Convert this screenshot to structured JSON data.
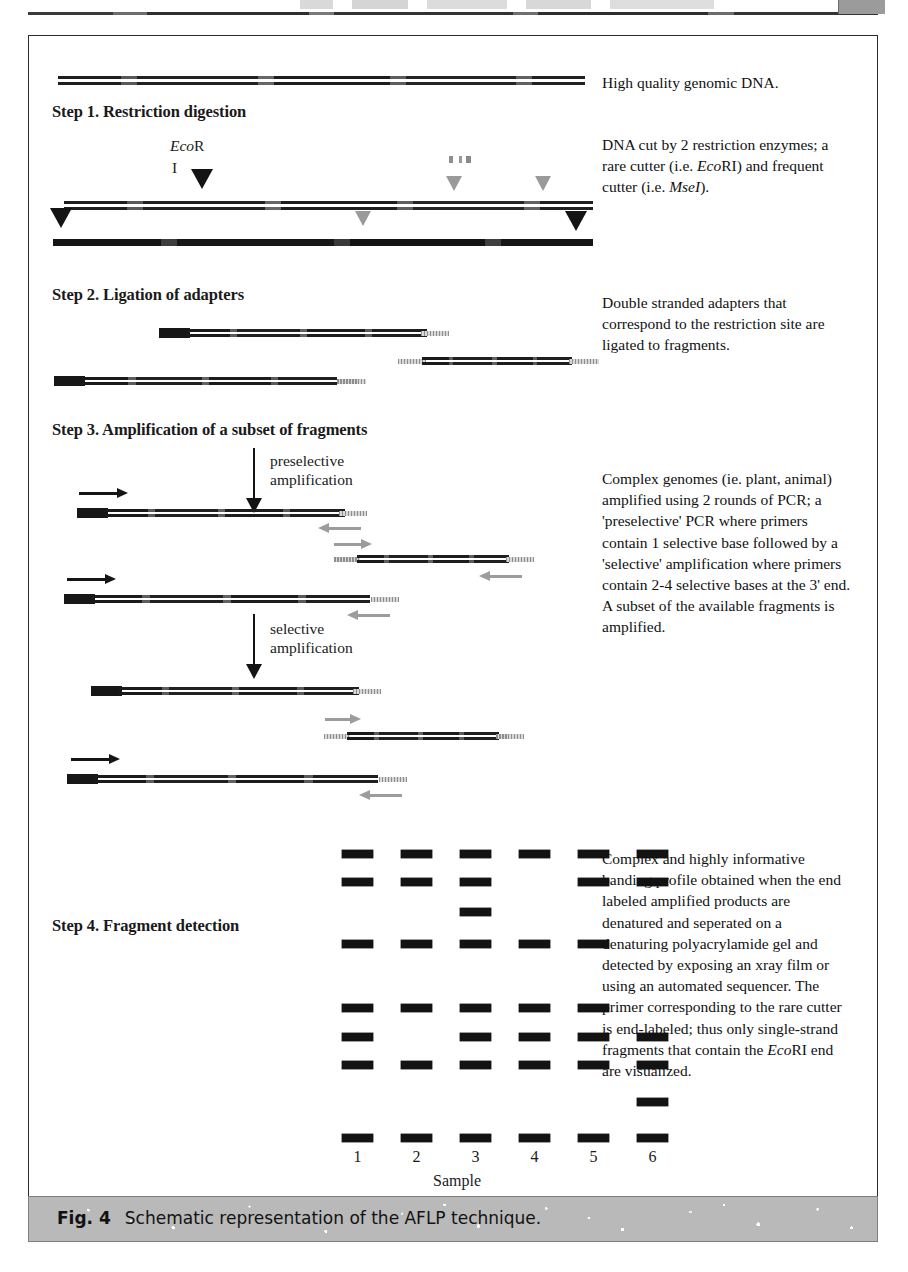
{
  "figure": {
    "caption_label": "Fig. 4",
    "caption_text": "Schematic representation of the AFLP technique."
  },
  "steps": [
    {
      "id": "step1",
      "heading": "Step 1. Restriction digestion"
    },
    {
      "id": "step2",
      "heading": "Step 2. Ligation of adapters"
    },
    {
      "id": "step3",
      "heading": "Step 3. Amplification of a subset of fragments"
    },
    {
      "id": "step4",
      "heading": "Step 4. Fragment detection"
    }
  ],
  "inline_labels": {
    "ecor_prefix": "Eco",
    "ecor_suffix": "R",
    "ecor_numeral": "I",
    "preselective_line1": "preselective",
    "preselective_line2": "amplification",
    "selective_line1": "selective",
    "selective_line2": "amplification"
  },
  "notes": [
    {
      "id": "note-genomic-dna",
      "text": "High quality genomic DNA."
    },
    {
      "id": "note-restriction",
      "segments": [
        {
          "t": "DNA cut by 2 restriction enzymes; a rare cutter (i.e. "
        },
        {
          "t": "Eco",
          "i": true
        },
        {
          "t": "RI) and frequent cutter (i.e. "
        },
        {
          "t": "MseI",
          "i": true
        },
        {
          "t": ")."
        }
      ]
    },
    {
      "id": "note-adapters",
      "text": "Double stranded adapters that correspond to the restriction site are ligated to fragments."
    },
    {
      "id": "note-amplification",
      "text": "Complex genomes (ie. plant, animal) amplified using 2 rounds of PCR; a 'preselective' PCR where primers contain 1 selective base followed by a 'selective' amplification  where primers contain 2-4 selective bases at the 3' end.  A subset of the available fragments is amplified."
    },
    {
      "id": "note-detection",
      "segments": [
        {
          "t": "Complex and highly informative banding profile obtained when the end labeled amplified products are denatured and seperated on a denaturing polyacrylamide gel and detected by exposing an xray film or using an automated sequencer.  The primer corresponding to the rare cutter is end-labeled; thus only single-strand fragments that contain the "
        },
        {
          "t": "Eco",
          "i": true
        },
        {
          "t": "RI end are visualized."
        }
      ]
    }
  ],
  "gel": {
    "axis_label": "Sample",
    "lanes": [
      "1",
      "2",
      "3",
      "4",
      "5",
      "6"
    ],
    "rows": [
      {
        "y": 814,
        "lanes": [
          1,
          2,
          3,
          4,
          5,
          6
        ]
      },
      {
        "y": 842,
        "lanes": [
          1,
          2,
          3,
          5,
          6
        ]
      },
      {
        "y": 872,
        "lanes": [
          3
        ]
      },
      {
        "y": 904,
        "lanes": [
          1,
          2,
          3,
          4,
          5
        ]
      },
      {
        "y": 968,
        "lanes": [
          1,
          2,
          3,
          4,
          5
        ]
      },
      {
        "y": 997,
        "lanes": [
          1,
          3,
          4,
          5,
          6
        ]
      },
      {
        "y": 1025,
        "lanes": [
          1,
          2,
          3,
          4,
          5,
          6
        ]
      },
      {
        "y": 1062,
        "lanes": [
          6
        ]
      },
      {
        "y": 1098,
        "lanes": [
          1,
          2,
          3,
          4,
          5,
          6
        ]
      }
    ],
    "lane_x": [
      313,
      372,
      431,
      490,
      549,
      608
    ]
  },
  "colors": {
    "ink": "#141414",
    "gray_marker": "#9a9a9a",
    "caption_bar": "#b9b9b9",
    "frame_border": "#2b2b2b"
  }
}
